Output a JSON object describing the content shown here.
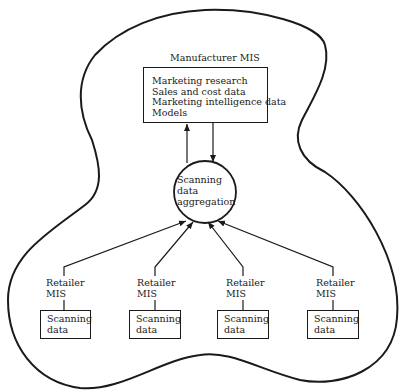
{
  "diagram": {
    "manufacturer": {
      "title": "Manufacturer MIS",
      "items": [
        "Marketing research",
        "Sales and cost data",
        "Marketing intelligence data",
        "Models"
      ]
    },
    "aggregation": {
      "lines": [
        "Scanning",
        "data",
        "aggregation"
      ]
    },
    "retailers": [
      {
        "label_line1": "Retailer",
        "label_line2": "MIS",
        "box_line1": "Scanning",
        "box_line2": "data"
      },
      {
        "label_line1": "Retailer",
        "label_line2": "MIS",
        "box_line1": "Scanning",
        "box_line2": "data"
      },
      {
        "label_line1": "Retailer",
        "label_line2": "MIS",
        "box_line1": "Scanning",
        "box_line2": "data"
      },
      {
        "label_line1": "Retailer",
        "label_line2": "MIS",
        "box_line1": "Scanning",
        "box_line2": "data"
      }
    ],
    "colors": {
      "stroke": "#1a1a1a",
      "background": "#ffffff"
    }
  }
}
